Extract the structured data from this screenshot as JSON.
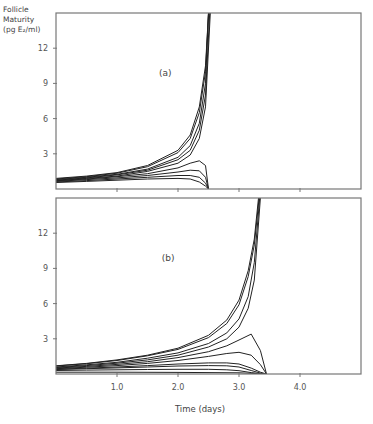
{
  "figure": {
    "y_axis_label_lines": [
      "Follicle",
      "Maturity",
      "(pg E₂/ml)"
    ],
    "x_axis_title": "Time (days)"
  },
  "chart_data": [
    {
      "type": "line",
      "panel_label": "(a)",
      "xlabel": "Time (days)",
      "ylabel": "Follicle Maturity (pg E2/ml)",
      "xlim": [
        0,
        5.0
      ],
      "ylim": [
        0,
        15
      ],
      "x_ticks": [
        1.0,
        2.0,
        3.0,
        4.0
      ],
      "x_tick_labels": [],
      "y_ticks": [
        3,
        6,
        9,
        12
      ],
      "y_tick_labels": [
        "3",
        "6",
        "9",
        "12"
      ],
      "grid": false,
      "series": [
        {
          "name": "a1",
          "x": [
            0,
            0.5,
            1.0,
            1.5,
            2.0,
            2.2,
            2.35,
            2.45,
            2.5
          ],
          "y": [
            0.9,
            1.1,
            1.4,
            2.0,
            3.3,
            4.6,
            7.0,
            10.5,
            15
          ]
        },
        {
          "name": "a2",
          "x": [
            0,
            0.5,
            1.0,
            1.5,
            2.0,
            2.2,
            2.35,
            2.45,
            2.5
          ],
          "y": [
            0.85,
            1.05,
            1.35,
            1.9,
            3.1,
            4.3,
            6.5,
            10.0,
            15
          ]
        },
        {
          "name": "a3",
          "x": [
            0,
            0.5,
            1.0,
            1.5,
            2.0,
            2.2,
            2.35,
            2.45,
            2.5
          ],
          "y": [
            0.8,
            1.0,
            1.25,
            1.7,
            2.7,
            3.7,
            5.6,
            9.0,
            15
          ]
        },
        {
          "name": "a4",
          "x": [
            0,
            0.5,
            1.0,
            1.5,
            2.0,
            2.2,
            2.35,
            2.45,
            2.52
          ],
          "y": [
            0.75,
            0.95,
            1.2,
            1.6,
            2.5,
            3.3,
            5.0,
            8.0,
            15
          ]
        },
        {
          "name": "a5",
          "x": [
            0,
            0.5,
            1.0,
            1.5,
            2.0,
            2.2,
            2.35,
            2.45,
            2.53
          ],
          "y": [
            0.7,
            0.9,
            1.1,
            1.5,
            2.2,
            2.9,
            4.3,
            7.0,
            15
          ]
        },
        {
          "name": "a6",
          "x": [
            0,
            0.5,
            1.0,
            1.5,
            2.0,
            2.2,
            2.35,
            2.45,
            2.5
          ],
          "y": [
            0.7,
            0.85,
            1.05,
            1.3,
            1.8,
            2.2,
            2.4,
            2.0,
            0
          ]
        },
        {
          "name": "a7",
          "x": [
            0,
            0.5,
            1.0,
            1.5,
            2.0,
            2.2,
            2.35,
            2.45,
            2.5
          ],
          "y": [
            0.65,
            0.8,
            0.95,
            1.15,
            1.45,
            1.6,
            1.55,
            1.0,
            0
          ]
        },
        {
          "name": "a8",
          "x": [
            0,
            0.5,
            1.0,
            1.5,
            2.0,
            2.2,
            2.35,
            2.45,
            2.5
          ],
          "y": [
            0.6,
            0.72,
            0.85,
            1.0,
            1.15,
            1.15,
            1.0,
            0.5,
            0
          ]
        },
        {
          "name": "a9",
          "x": [
            0,
            0.5,
            1.0,
            1.5,
            2.0,
            2.2,
            2.35,
            2.45,
            2.5
          ],
          "y": [
            0.55,
            0.65,
            0.75,
            0.85,
            0.9,
            0.85,
            0.6,
            0.25,
            0
          ]
        }
      ]
    },
    {
      "type": "line",
      "panel_label": "(b)",
      "xlabel": "Time (days)",
      "ylabel": "Follicle Maturity (pg E2/ml)",
      "xlim": [
        0,
        5.0
      ],
      "ylim": [
        0,
        15
      ],
      "x_ticks": [
        1.0,
        2.0,
        3.0,
        4.0
      ],
      "x_tick_labels": [
        "1.0",
        "2.0",
        "3.0",
        "4.0"
      ],
      "y_ticks": [
        3,
        6,
        9,
        12
      ],
      "y_tick_labels": [
        "3",
        "6",
        "9",
        "12"
      ],
      "grid": false,
      "series": [
        {
          "name": "b1",
          "x": [
            0,
            0.5,
            1.0,
            1.5,
            2.0,
            2.5,
            2.8,
            3.0,
            3.15,
            3.25,
            3.32
          ],
          "y": [
            0.7,
            0.9,
            1.2,
            1.6,
            2.2,
            3.3,
            4.6,
            6.3,
            8.8,
            11.5,
            15
          ]
        },
        {
          "name": "b2",
          "x": [
            0,
            0.5,
            1.0,
            1.5,
            2.0,
            2.5,
            2.8,
            3.0,
            3.15,
            3.25,
            3.33
          ],
          "y": [
            0.68,
            0.88,
            1.15,
            1.55,
            2.1,
            3.1,
            4.3,
            5.9,
            8.3,
            11.0,
            15
          ]
        },
        {
          "name": "b3",
          "x": [
            0,
            0.5,
            1.0,
            1.5,
            2.0,
            2.5,
            2.8,
            3.0,
            3.15,
            3.25,
            3.34
          ],
          "y": [
            0.6,
            0.78,
            1.0,
            1.35,
            1.8,
            2.6,
            3.5,
            4.7,
            6.6,
            9.5,
            15
          ]
        },
        {
          "name": "b4",
          "x": [
            0,
            0.5,
            1.0,
            1.5,
            2.0,
            2.5,
            2.8,
            3.0,
            3.15,
            3.25,
            3.35
          ],
          "y": [
            0.55,
            0.72,
            0.92,
            1.2,
            1.6,
            2.3,
            3.0,
            4.0,
            5.6,
            8.0,
            15
          ]
        },
        {
          "name": "b5",
          "x": [
            0,
            0.5,
            1.0,
            1.5,
            2.0,
            2.5,
            2.8,
            3.0,
            3.2,
            3.35,
            3.45
          ],
          "y": [
            0.5,
            0.65,
            0.82,
            1.05,
            1.4,
            1.9,
            2.4,
            2.9,
            3.4,
            2.0,
            0
          ]
        },
        {
          "name": "b6",
          "x": [
            0,
            0.5,
            1.0,
            1.5,
            2.0,
            2.5,
            2.8,
            3.0,
            3.2,
            3.35,
            3.45
          ],
          "y": [
            0.45,
            0.58,
            0.72,
            0.9,
            1.15,
            1.5,
            1.75,
            1.85,
            1.6,
            0.8,
            0
          ]
        },
        {
          "name": "b7",
          "x": [
            0,
            0.5,
            1.0,
            1.5,
            2.0,
            2.5,
            2.8,
            3.0,
            3.2,
            3.35,
            3.45
          ],
          "y": [
            0.4,
            0.5,
            0.6,
            0.72,
            0.85,
            0.95,
            0.95,
            0.85,
            0.5,
            0.15,
            0
          ]
        },
        {
          "name": "b8",
          "x": [
            0,
            0.5,
            1.0,
            1.5,
            2.0,
            2.5,
            2.8,
            3.0,
            3.2,
            3.35,
            3.45
          ],
          "y": [
            0.38,
            0.45,
            0.52,
            0.6,
            0.68,
            0.72,
            0.7,
            0.6,
            0.3,
            0.08,
            0
          ]
        },
        {
          "name": "b9",
          "x": [
            0,
            0.5,
            1.0,
            1.5,
            2.0,
            2.5,
            2.8,
            3.0,
            3.2,
            3.35,
            3.45
          ],
          "y": [
            0.3,
            0.33,
            0.36,
            0.38,
            0.4,
            0.4,
            0.36,
            0.28,
            0.12,
            0.03,
            0
          ]
        },
        {
          "name": "b10",
          "x": [
            0,
            1.0,
            2.0,
            3.0,
            3.3,
            3.45
          ],
          "y": [
            0.15,
            0.15,
            0.14,
            0.1,
            0.03,
            0
          ]
        }
      ]
    }
  ]
}
